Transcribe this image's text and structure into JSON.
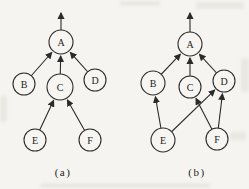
{
  "page": {
    "background_color": "#f5f4f0",
    "ink_color": "#2b2b2b"
  },
  "diagrams": [
    {
      "key": "a",
      "caption": "(a)",
      "caption_x": 63,
      "caption_y": 172,
      "nodes": [
        {
          "id": "A",
          "x": 61,
          "y": 42,
          "r": 12
        },
        {
          "id": "B",
          "x": 24,
          "y": 84,
          "r": 11
        },
        {
          "id": "C",
          "x": 60,
          "y": 87,
          "r": 13
        },
        {
          "id": "D",
          "x": 95,
          "y": 80,
          "r": 11
        },
        {
          "id": "E",
          "x": 35,
          "y": 140,
          "r": 11
        },
        {
          "id": "F",
          "x": 90,
          "y": 140,
          "r": 11
        }
      ],
      "edges": [
        {
          "from": "B",
          "to": "A"
        },
        {
          "from": "C",
          "to": "A"
        },
        {
          "from": "D",
          "to": "A"
        },
        {
          "from": "E",
          "to": "C"
        },
        {
          "from": "F",
          "to": "C"
        }
      ],
      "exit_arrow": {
        "from": "A",
        "tip_dx": 0,
        "tip_dy": -29
      }
    },
    {
      "key": "b",
      "caption": "(b)",
      "caption_x": 197,
      "caption_y": 172,
      "nodes": [
        {
          "id": "A",
          "x": 190,
          "y": 44,
          "r": 12
        },
        {
          "id": "B",
          "x": 153,
          "y": 83,
          "r": 12
        },
        {
          "id": "C",
          "x": 190,
          "y": 87,
          "r": 11
        },
        {
          "id": "D",
          "x": 224,
          "y": 81,
          "r": 11
        },
        {
          "id": "E",
          "x": 163,
          "y": 140,
          "r": 12
        },
        {
          "id": "F",
          "x": 217,
          "y": 139,
          "r": 11
        }
      ],
      "edges": [
        {
          "from": "B",
          "to": "A"
        },
        {
          "from": "C",
          "to": "A"
        },
        {
          "from": "D",
          "to": "A"
        },
        {
          "from": "E",
          "to": "B"
        },
        {
          "from": "E",
          "to": "D"
        },
        {
          "from": "F",
          "to": "C"
        },
        {
          "from": "F",
          "to": "D"
        }
      ],
      "exit_arrow": {
        "from": "A",
        "tip_dx": 0,
        "tip_dy": -31
      }
    }
  ]
}
